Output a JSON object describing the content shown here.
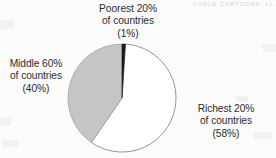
{
  "figure": {
    "background_color": "#fbfbfb",
    "watermark": "CAGLE CARTOONS, LL"
  },
  "labels": {
    "poorest": {
      "line1": "Poorest 20%",
      "line2": "of countries",
      "line3": "(1%)"
    },
    "middle": {
      "line1": "Middle 60%",
      "line2": "of countries",
      "line3": "(40%)"
    },
    "richest": {
      "line1": "Richest 20%",
      "line2": "of countries",
      "line3": "(58%)"
    }
  },
  "chart_data": {
    "type": "pie",
    "title": "",
    "categories": [
      "Poorest 20% of countries",
      "Richest 20% of countries",
      "Middle 60% of countries"
    ],
    "values": [
      1,
      58,
      40
    ],
    "value_labels": [
      "(1%)",
      "(58%)",
      "(40%)"
    ],
    "colors": [
      "#1a1a1a",
      "#ffffff",
      "#c5c5c5"
    ],
    "slice_colors": {
      "poorest": "#1a1a1a",
      "richest": "#ffffff",
      "middle": "#c5c5c5"
    },
    "outline_color": "#8a8a8a",
    "start_angle_deg": 0,
    "direction": "clockwise",
    "legend": "none",
    "labels_position": "outside",
    "center": [
      122,
      98
    ],
    "radius": 54,
    "xlabel": "",
    "ylabel": ""
  }
}
